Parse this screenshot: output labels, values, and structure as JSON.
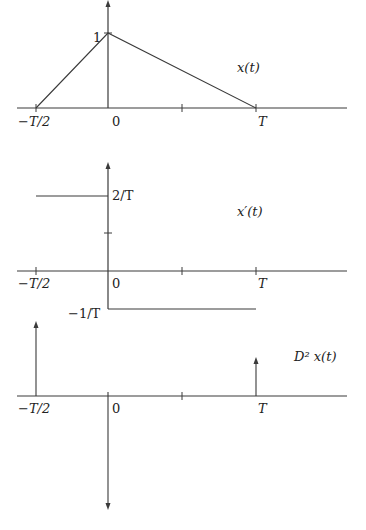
{
  "plots": [
    {
      "id": "x",
      "title": "x(t)",
      "xticks": [
        {
          "label": "−T/2"
        },
        {
          "label": "0"
        },
        {
          "label": "T"
        }
      ],
      "yticks": [
        {
          "label": "1"
        }
      ],
      "description": "Triangular pulse: rises linearly from 0 at -T/2 to 1 at 0, then falls linearly to 0 at T"
    },
    {
      "id": "xprime",
      "title": "x′(t)",
      "xticks": [
        {
          "label": "−T/2"
        },
        {
          "label": "0"
        },
        {
          "label": "T"
        }
      ],
      "yticks": [
        {
          "label": "2/T"
        },
        {
          "label": "−1/T"
        }
      ],
      "description": "Piecewise constant: 2/T on (-T/2, 0), -1/T on (0, T), zero elsewhere"
    },
    {
      "id": "d2x",
      "title": "D² x(t)",
      "xticks": [
        {
          "label": "−T/2"
        },
        {
          "label": "0"
        },
        {
          "label": "T"
        }
      ],
      "description": "Impulses: positive at -T/2, large negative at 0, small positive at T"
    }
  ],
  "colors": {
    "line": "#3a3a3a",
    "text": "#222222",
    "background": "#ffffff"
  }
}
